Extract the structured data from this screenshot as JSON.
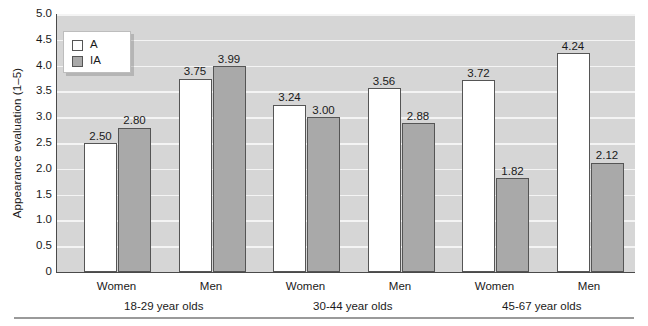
{
  "chart_data": {
    "type": "bar",
    "title": "",
    "xlabel": "",
    "ylabel": "Appearance evaluation (1–5)",
    "ylim": [
      0,
      5.0
    ],
    "ytick_labels": [
      "5.0",
      "4.5",
      "4.0",
      "3.5",
      "3.0",
      "2.5",
      "2.0",
      "1.5",
      "1.0",
      "0.5",
      "0"
    ],
    "ytick_values": [
      5.0,
      4.5,
      4.0,
      3.5,
      3.0,
      2.5,
      2.0,
      1.5,
      1.0,
      0.5,
      0
    ],
    "grid": true,
    "legend_position": "upper-left",
    "categories": [
      "Women",
      "Men",
      "Women",
      "Men",
      "Women",
      "Men"
    ],
    "group_labels": [
      "18-29 year olds",
      "30-44 year olds",
      "45-67 year olds"
    ],
    "series": [
      {
        "name": "A",
        "values": [
          2.5,
          3.75,
          3.24,
          3.56,
          3.72,
          4.24
        ]
      },
      {
        "name": "IA",
        "values": [
          2.8,
          3.99,
          3.0,
          2.88,
          1.82,
          2.12
        ]
      }
    ],
    "value_labels": [
      "2.50",
      "2.80",
      "3.75",
      "3.99",
      "3.24",
      "3.00",
      "3.56",
      "2.88",
      "3.72",
      "1.82",
      "4.24",
      "2.12"
    ],
    "colors": {
      "series_a_fill": "#ffffff",
      "series_ia_fill": "#a9a9a9",
      "bar_outline": "#555555",
      "plot_background": "#d6d6d6",
      "gridline": "#f4f4f4",
      "axis": "#4a4a4a",
      "text": "#1a1a1a"
    }
  },
  "legend": {
    "items": [
      {
        "key": "a",
        "label": "A"
      },
      {
        "key": "ia",
        "label": "IA"
      }
    ]
  },
  "axes": {
    "y_title": "Appearance evaluation (1–5)",
    "y_ticks": [
      "5.0",
      "4.5",
      "4.0",
      "3.5",
      "3.0",
      "2.5",
      "2.0",
      "1.5",
      "1.0",
      "0.5",
      "0"
    ]
  },
  "x_axis": {
    "tier1": [
      "Women",
      "Men",
      "Women",
      "Men",
      "Women",
      "Men"
    ],
    "tier2": [
      "18-29 year olds",
      "30-44 year olds",
      "45-67 year olds"
    ]
  },
  "bars": [
    {
      "series": "a",
      "value_label": "2.50",
      "value": 2.5
    },
    {
      "series": "ia",
      "value_label": "2.80",
      "value": 2.8
    },
    {
      "series": "a",
      "value_label": "3.75",
      "value": 3.75
    },
    {
      "series": "ia",
      "value_label": "3.99",
      "value": 3.99
    },
    {
      "series": "a",
      "value_label": "3.24",
      "value": 3.24
    },
    {
      "series": "ia",
      "value_label": "3.00",
      "value": 3.0
    },
    {
      "series": "a",
      "value_label": "3.56",
      "value": 3.56
    },
    {
      "series": "ia",
      "value_label": "2.88",
      "value": 2.88
    },
    {
      "series": "a",
      "value_label": "3.72",
      "value": 3.72
    },
    {
      "series": "ia",
      "value_label": "1.82",
      "value": 1.82
    },
    {
      "series": "a",
      "value_label": "4.24",
      "value": 4.24
    },
    {
      "series": "ia",
      "value_label": "2.12",
      "value": 2.12
    }
  ]
}
